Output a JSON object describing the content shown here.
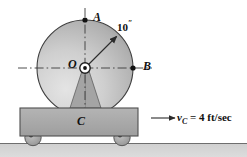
{
  "figure": {
    "background_color": "#ffffff",
    "labels": {
      "point_a": "A",
      "point_b": "B",
      "center_o": "O",
      "cart_c": "C",
      "radius_value": "10",
      "radius_unit": "″",
      "velocity_symbol": "v",
      "velocity_subscript": "C",
      "velocity_equation": " = 4 ft/sec"
    },
    "colors": {
      "disk_light": "#d8d8d8",
      "disk_dark": "#9a9a9a",
      "disk_outline": "#3a3a3a",
      "cart_fill": "#a9a9a9",
      "cart_outline": "#4a4a4a",
      "support_fill": "#a0a0a0",
      "ground_fill": "#c9c9c9",
      "wheel_fill": "#b0b0b0",
      "line_color": "#333333",
      "hub_fill": "#ffffff",
      "text_color": "#111111"
    },
    "geometry": {
      "disk_center_x": 85,
      "disk_center_y": 68,
      "disk_radius": 48,
      "point_a_x": 85,
      "point_a_y": 20,
      "point_b_x": 133,
      "point_b_y": 68,
      "radius_arrow_angle_deg": 45,
      "cart_left": 20,
      "cart_top": 108,
      "cart_width": 118,
      "cart_height": 28,
      "ground_top": 143,
      "ground_height": 14,
      "wheel_left_cx": 33,
      "wheel_right_cx": 122,
      "wheel_cy": 138,
      "wheel_radius": 8,
      "velocity_arrow_x1": 152,
      "velocity_arrow_x2": 176,
      "velocity_arrow_y": 118
    }
  }
}
